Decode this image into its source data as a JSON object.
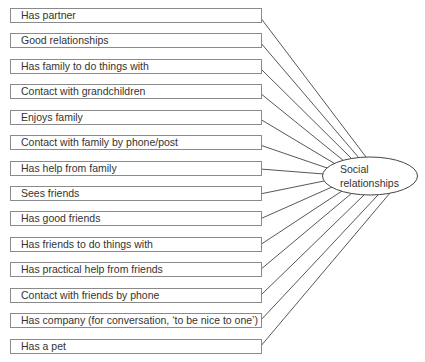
{
  "diagram": {
    "center": {
      "line1": "Social",
      "line2": "relationships"
    },
    "items": [
      {
        "label": "Has partner"
      },
      {
        "label": "Good relationships"
      },
      {
        "label": "Has family to do things with"
      },
      {
        "label": "Contact with grandchildren"
      },
      {
        "label": "Enjoys family"
      },
      {
        "label": "Contact with family by phone/post"
      },
      {
        "label": "Has help from family"
      },
      {
        "label": "Sees friends"
      },
      {
        "label": "Has good friends"
      },
      {
        "label": "Has friends to do things with"
      },
      {
        "label": "Has practical help from friends"
      },
      {
        "label": "Contact with friends by phone"
      },
      {
        "label": "Has company (for conversation, ‘to be nice to one’)"
      },
      {
        "label": "Has a pet"
      }
    ]
  }
}
